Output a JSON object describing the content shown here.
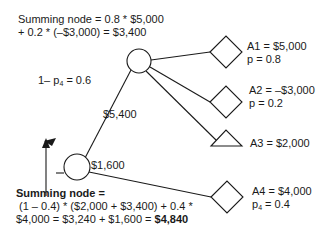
{
  "top_annotation": {
    "line1": "Summing node = 0.8 * $5,000",
    "line2": "+ 0.2 * (–$3,000) = $3,400"
  },
  "branch_labels": {
    "prob_upper": "1– p",
    "prob_upper_sub": "4",
    "prob_upper_value": " = 0.6",
    "upper_value": "$5,400",
    "lower_value": "$1,600"
  },
  "outcomes": [
    {
      "id": "A1",
      "label": "A1 = $5,000",
      "prob": "p = 0.8",
      "shape": "diamond"
    },
    {
      "id": "A2",
      "label": "A2 = –$3,000",
      "prob": "p = 0.2",
      "shape": "diamond"
    },
    {
      "id": "A3",
      "label": "A3 = $2,000",
      "prob": "",
      "shape": "triangle"
    },
    {
      "id": "A4",
      "label": "A4 = $4,000",
      "prob_prefix": "p",
      "prob_sub": "4",
      "prob_value": " = 0.4",
      "shape": "diamond"
    }
  ],
  "bottom_annotation": {
    "title": "Summing node =",
    "line1": "(1 – 0.4) * ($2,000 + $3,400) + 0.4 *",
    "line2_prefix": "$4,000 = $3,240 + $1,600 = ",
    "line2_result": "$4,840"
  },
  "colors": {
    "stroke": "#1a1a1a",
    "background": "#ffffff"
  }
}
